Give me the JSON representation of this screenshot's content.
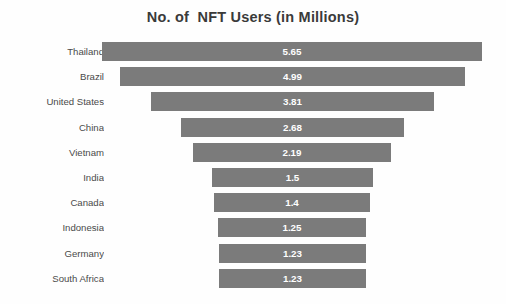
{
  "chart_data": {
    "type": "bar",
    "subtype": "funnel",
    "title": "No. of  NFT Users (in Millions)",
    "xlabel": "",
    "ylabel": "",
    "categories": [
      "Thailand",
      "Brazil",
      "United States",
      "China",
      "Vietnam",
      "India",
      "Canada",
      "Indonesia",
      "Germany",
      "South Africa"
    ],
    "values": [
      5.65,
      4.99,
      3.81,
      2.68,
      2.19,
      1.5,
      1.4,
      1.25,
      1.23,
      1.23
    ],
    "value_labels": [
      "5.65",
      "4.99",
      "3.81",
      "2.68",
      "2.19",
      "1.5",
      "1.4",
      "1.25",
      "1.23",
      "1.23"
    ],
    "xlim": [
      0,
      5.65
    ],
    "grid": false,
    "legend": false,
    "orientation": "horizontal-centered",
    "bar_color": "#7b7b7b",
    "value_label_color": "#ffffff",
    "category_label_color": "#4a4a4a",
    "title_color": "#3a3a3a",
    "background_color": "#fefefe"
  }
}
